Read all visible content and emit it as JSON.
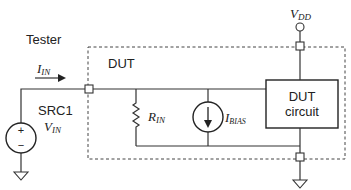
{
  "labels": {
    "tester": "Tester",
    "dut": "DUT",
    "src1": "SRC1",
    "vdd_main": "V",
    "vdd_sub": "DD",
    "iin_main": "I",
    "iin_sub": "IN",
    "vin_main": "V",
    "vin_sub": "IN",
    "rin_main": "R",
    "rin_sub": "IN",
    "ibias_main": "I",
    "ibias_sub": "BIAS",
    "dut_circuit_line1": "DUT",
    "dut_circuit_line2": "circuit",
    "plus": "+",
    "minus": "−"
  }
}
